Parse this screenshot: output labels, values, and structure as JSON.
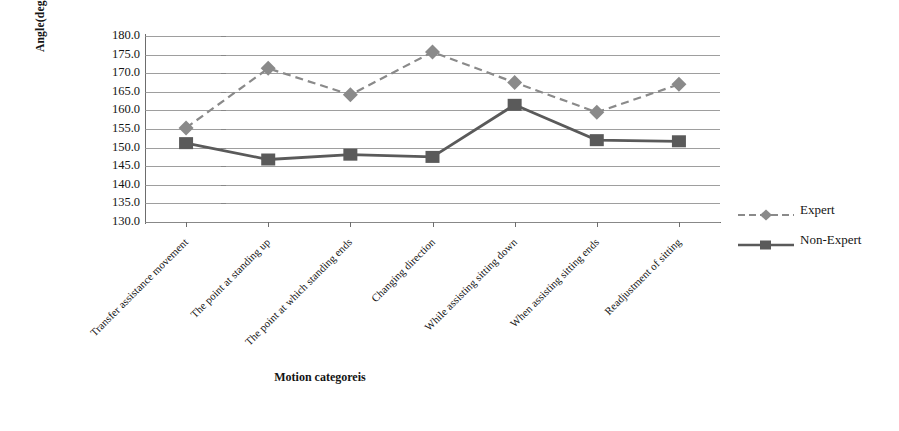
{
  "chart_data": {
    "type": "line",
    "title": "",
    "xlabel": "Motion categoreis",
    "ylabel": "Angle(degree)",
    "ylim": [
      130.0,
      180.0
    ],
    "ytick_step": 5.0,
    "yticks": [
      "180.0",
      "175.0",
      "170.0",
      "165.0",
      "160.0",
      "155.0",
      "150.0",
      "145.0",
      "140.0",
      "135.0",
      "130.0"
    ],
    "grid": true,
    "legend_position": "right",
    "categories": [
      "Transfer assistance movement",
      "The point at standing up",
      "The point at which standing ends",
      "Changing direction",
      "While assisting sitting down",
      "When assisting sitting ends",
      "Readjustment of sitting"
    ],
    "series": [
      {
        "name": "Expert",
        "marker": "diamond",
        "line_style": "dashed",
        "color": "#8a8a8a",
        "values": [
          155.3,
          171.3,
          164.2,
          175.7,
          167.5,
          159.5,
          167.0
        ]
      },
      {
        "name": "Non-Expert",
        "marker": "square",
        "line_style": "solid",
        "color": "#5a5a5a",
        "values": [
          151.2,
          146.8,
          148.1,
          147.5,
          161.5,
          152.0,
          151.7
        ]
      }
    ]
  },
  "legend": {
    "items": [
      {
        "label": "Expert"
      },
      {
        "label": "Non-Expert"
      }
    ]
  },
  "axes": {
    "y_title": "Angle(degree)",
    "x_title": "Motion categoreis"
  }
}
